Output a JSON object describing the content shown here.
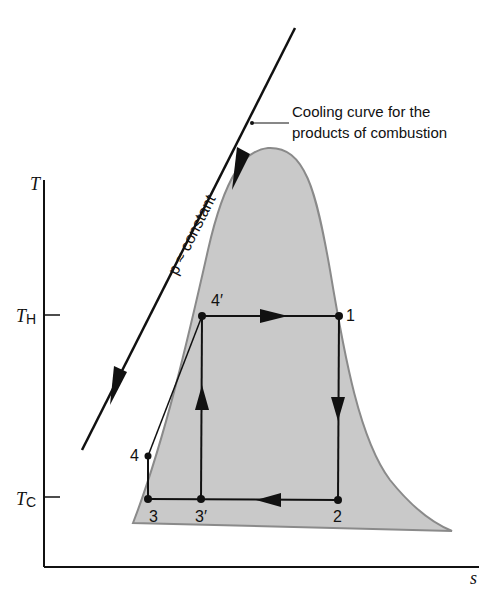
{
  "diagram": {
    "type": "T-s diagram",
    "axes": {
      "y_label": "T",
      "x_label": "s",
      "ticks": [
        {
          "label": "T",
          "subscript": "H",
          "y": 315
        },
        {
          "label": "T",
          "subscript": "C",
          "y": 498
        }
      ]
    },
    "annotation": {
      "line1": "Cooling curve for the",
      "line2": "products of combustion"
    },
    "pressure_label": "p ≈ constant",
    "points": [
      {
        "id": "1",
        "label": "1",
        "x": 339,
        "y": 316
      },
      {
        "id": "2",
        "label": "2",
        "x": 338,
        "y": 500
      },
      {
        "id": "3",
        "label": "3",
        "x": 148,
        "y": 499
      },
      {
        "id": "3p",
        "label": "3′",
        "x": 201,
        "y": 499
      },
      {
        "id": "4",
        "label": "4",
        "x": 148,
        "y": 456
      },
      {
        "id": "4p",
        "label": "4′",
        "x": 202,
        "y": 316
      }
    ],
    "colors": {
      "dome_fill": "#c8c8c8",
      "dome_edge": "#8a8a8a",
      "line": "#111111"
    }
  }
}
